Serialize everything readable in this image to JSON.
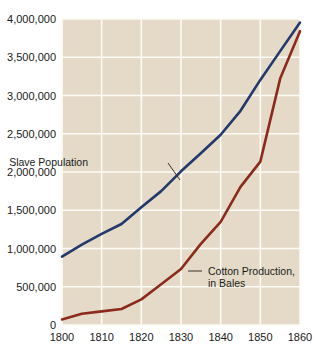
{
  "chart_data": {
    "type": "line",
    "title": "",
    "subtitle": "",
    "xlabel": "",
    "ylabel": "",
    "xlim": [
      1800,
      1860
    ],
    "ylim": [
      0,
      4000000
    ],
    "grid": true,
    "legend_position": "inline-annotations",
    "plot_background": "#e4dac7",
    "gridline_color": "#fdfbf6",
    "x_ticks": [
      "1800",
      "1810",
      "1820",
      "1830",
      "1840",
      "1850",
      "1860"
    ],
    "x_tick_values": [
      1800,
      1810,
      1820,
      1830,
      1840,
      1850,
      1860
    ],
    "y_ticks": [
      "0",
      "500,000",
      "1,000,000",
      "1,500,000",
      "2,000,000",
      "2,500,000",
      "3,000,000",
      "3,500,000",
      "4,000,000"
    ],
    "y_tick_values": [
      0,
      500000,
      1000000,
      1500000,
      2000000,
      2500000,
      3000000,
      3500000,
      4000000
    ],
    "series": [
      {
        "name": "Slave Population",
        "color": "#23386b",
        "label_text": "Slave Population",
        "x": [
          1800,
          1805,
          1810,
          1815,
          1820,
          1825,
          1830,
          1835,
          1840,
          1845,
          1850,
          1855,
          1860
        ],
        "values": [
          893000,
          1050000,
          1191000,
          1320000,
          1538000,
          1750000,
          2009000,
          2245000,
          2487000,
          2800000,
          3204000,
          3580000,
          3954000
        ]
      },
      {
        "name": "Cotton Production, in Bales",
        "color": "#8b2a1d",
        "label_text": "Cotton Production,",
        "label_text_2": "in Bales",
        "x": [
          1800,
          1805,
          1810,
          1815,
          1820,
          1825,
          1830,
          1835,
          1840,
          1845,
          1850,
          1855,
          1860
        ],
        "values": [
          73000,
          146000,
          178000,
          209000,
          335000,
          533000,
          732000,
          1060000,
          1348000,
          1805000,
          2136000,
          3221000,
          3841000
        ]
      }
    ],
    "annotations": [
      {
        "text": "Slave Population",
        "x_px": 88,
        "y_px": 166,
        "leader_from_px": [
          168,
          163
        ],
        "leader_to_px": [
          180,
          180
        ]
      },
      {
        "text": "Cotton Production,",
        "text2": "in Bales",
        "x_px": 208,
        "y_px": 275,
        "leader_from_px": [
          188,
          271
        ],
        "leader_to_px": [
          202,
          271
        ]
      }
    ]
  }
}
